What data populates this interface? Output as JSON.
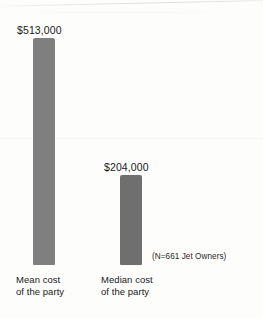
{
  "chart_data": {
    "type": "bar",
    "title": "",
    "subtitle": "",
    "xlabel": "",
    "ylabel": "",
    "grid": false,
    "legend": null,
    "orientation": "vertical",
    "categories": [
      "Mean cost of the party",
      "Median cost of the party"
    ],
    "values": [
      513000,
      204000
    ],
    "value_labels": [
      "$513,000",
      "$204,000"
    ],
    "ylim": [
      0,
      513000
    ],
    "annotation": "(N=661 Jet Owners)",
    "bar_colors": [
      "#7f7f7f",
      "#6f6f6f"
    ],
    "background_color": "#fdfdfc",
    "text_color": "#1b1b1b"
  },
  "bars": [
    {
      "key": "mean",
      "value_label": "$513,000",
      "category_line1": "Mean cost",
      "category_line2": "of the party",
      "color": "#7f7f7f"
    },
    {
      "key": "median",
      "value_label": "$204,000",
      "category_line1": "Median cost",
      "category_line2": "of the party",
      "color": "#6f6f6f"
    }
  ],
  "note": {
    "text": "(N=661 Jet Owners)"
  }
}
